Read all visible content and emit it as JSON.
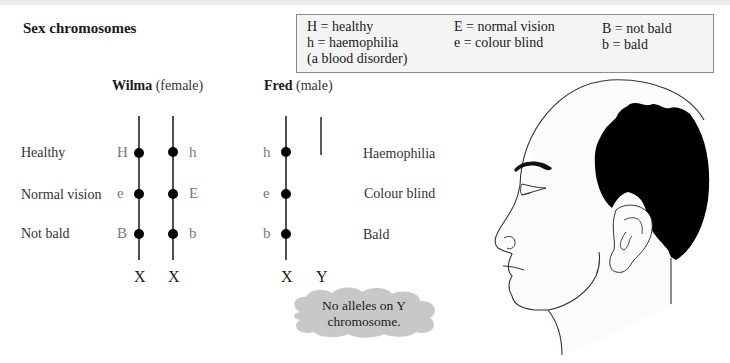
{
  "title": "Sex chromosomes",
  "key": {
    "columns": [
      [
        "H = healthy",
        "h = haemophilia",
        "(a blood disorder)"
      ],
      [
        "E = normal vision",
        "e = colour blind"
      ],
      [
        "B = not bald",
        "b = bald"
      ]
    ]
  },
  "wilma": {
    "name": "Wilma",
    "sex": "(female)",
    "traits": [
      "Healthy",
      "Normal vision",
      "Not bald"
    ],
    "chromosome1_alleles": [
      "H",
      "e",
      "B"
    ],
    "chromosome2_alleles": [
      "h",
      "E",
      "b"
    ],
    "chromosome_labels": [
      "X",
      "X"
    ]
  },
  "fred": {
    "name": "Fred",
    "sex": "(male)",
    "traits": [
      "Haemophilia",
      "Colour blind",
      "Bald"
    ],
    "x_alleles": [
      "h",
      "e",
      "b"
    ],
    "chromosome_labels": [
      "X",
      "Y"
    ]
  },
  "callout": {
    "line1": "No alleles on Y",
    "line2": "chromosome."
  },
  "colors": {
    "allele_text": "#7a7a7a",
    "key_box_fill": "#f4f4f4",
    "key_box_border": "#8a8a8a",
    "cloud_fill": "#c8c8c8",
    "hair": "#000000"
  }
}
